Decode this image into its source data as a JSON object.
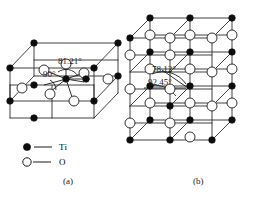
{
  "figure": {
    "kind": "crystal-structure-diagram",
    "panels": [
      {
        "id": "a",
        "caption": "(a)",
        "cell_type": "single unit cell",
        "angles": [
          {
            "label": "81.21°",
            "value": 81.21,
            "x": 60,
            "y": 63
          },
          {
            "label": "90°",
            "value": 90,
            "x": 45,
            "y": 76
          }
        ]
      },
      {
        "id": "b",
        "caption": "(b)",
        "cell_type": "2x2x2 supercell",
        "angles": [
          {
            "label": "78.12°",
            "value": 78.12,
            "x": 156,
            "y": 69
          },
          {
            "label": "92.45°",
            "value": 92.45,
            "x": 152,
            "y": 82
          }
        ]
      }
    ]
  },
  "legend": {
    "items": [
      {
        "marker": "filled-circle",
        "symbol": "Ti",
        "color": "#000000"
      },
      {
        "marker": "open-circle",
        "symbol": "O",
        "color": "#ffffff"
      }
    ]
  },
  "colors": {
    "line": "#2b2b2b",
    "atom_ti_fill": "#0d0d0d",
    "atom_o_fill": "#ffffff",
    "atom_stroke": "#1a1a1a",
    "background": "#ffffff"
  }
}
